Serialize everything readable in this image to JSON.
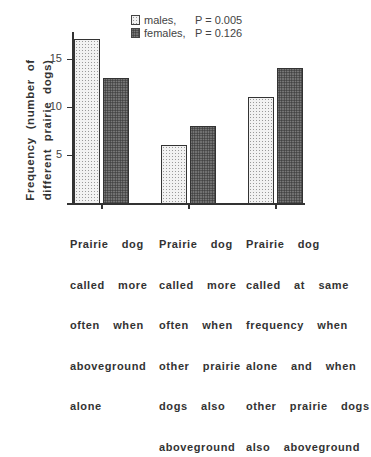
{
  "chart_data": {
    "type": "bar",
    "title": "",
    "xlabel": "",
    "ylabel": "Frequency (number of different prairie dogs)",
    "ylabel_lines": [
      "Frequency  (number  of",
      "different   prairie   dogs)"
    ],
    "ylim": [
      0,
      17.5
    ],
    "yticks": [
      5,
      10,
      15
    ],
    "grid": false,
    "legend_position": "top-right",
    "categories": [
      "Prairie dog called more often when aboveground alone",
      "Prairie dog called more often when other prairie dogs also aboveground",
      "Prairie dog called at same frequency when alone and when other prairie dogs also aboveground"
    ],
    "category_label_lines": [
      [
        "Prairie  dog",
        "called  more",
        "often  when",
        "aboveground",
        "alone"
      ],
      [
        "Prairie  dog",
        "called  more",
        "often  when",
        "other  prairie",
        "dogs  also",
        "aboveground"
      ],
      [
        "Prairie  dog",
        "called  at  same",
        "frequency  when",
        "alone  and  when",
        "other  prairie  dogs",
        "also  aboveground"
      ]
    ],
    "series": [
      {
        "name": "males",
        "legend_label": "males,",
        "p_value": "P = 0.005",
        "values": [
          17,
          6,
          11
        ],
        "fill": "light stippled"
      },
      {
        "name": "females",
        "legend_label": "females,",
        "p_value": "P = 0.126",
        "values": [
          13,
          8,
          14
        ],
        "fill": "dark stippled"
      }
    ]
  },
  "labels": {
    "tick_5": "5",
    "tick_10": "10",
    "tick_15": "15"
  }
}
